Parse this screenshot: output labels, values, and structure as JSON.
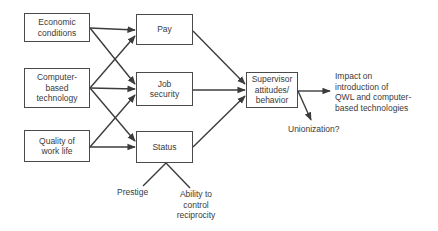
{
  "diagram": {
    "inputs": [
      {
        "id": "economic",
        "lines": [
          "Economic",
          "conditions"
        ]
      },
      {
        "id": "computer",
        "lines": [
          "Computer-",
          "based",
          "technology"
        ]
      },
      {
        "id": "quality",
        "lines": [
          "Quality of",
          "work life"
        ]
      }
    ],
    "mediators": [
      {
        "id": "pay",
        "lines": [
          "Pay"
        ]
      },
      {
        "id": "job_security",
        "lines": [
          "Job",
          "security"
        ]
      },
      {
        "id": "status",
        "lines": [
          "Status"
        ]
      }
    ],
    "central": {
      "id": "supervisor",
      "lines": [
        "Supervisor",
        "attitudes/",
        "behavior"
      ]
    },
    "outcomes": {
      "impact": {
        "lines": [
          "Impact on",
          "introduction of",
          "QWL and computer-",
          "based technologies"
        ]
      },
      "unionization": {
        "text": "Unionization?"
      }
    },
    "status_components": {
      "prestige": {
        "text": "Prestige"
      },
      "ability": {
        "lines": [
          "Ability to",
          "control",
          "reciprocity"
        ]
      }
    },
    "edges": [
      {
        "from": "Economic conditions",
        "to": "Pay",
        "type": "arrow"
      },
      {
        "from": "Economic conditions",
        "to": "Job security",
        "type": "arrow"
      },
      {
        "from": "Computer-based technology",
        "to": "Pay",
        "type": "arrow"
      },
      {
        "from": "Computer-based technology",
        "to": "Job security",
        "type": "arrow"
      },
      {
        "from": "Computer-based technology",
        "to": "Status",
        "type": "arrow"
      },
      {
        "from": "Quality of work life",
        "to": "Job security",
        "type": "arrow"
      },
      {
        "from": "Quality of work life",
        "to": "Status",
        "type": "arrow"
      },
      {
        "from": "Pay",
        "to": "Supervisor attitudes/behavior",
        "type": "arrow"
      },
      {
        "from": "Job security",
        "to": "Supervisor attitudes/behavior",
        "type": "arrow"
      },
      {
        "from": "Status",
        "to": "Supervisor attitudes/behavior",
        "type": "arrow"
      },
      {
        "from": "Supervisor attitudes/behavior",
        "to": "Impact on introduction of QWL and computer-based technologies",
        "type": "arrow"
      },
      {
        "from": "Supervisor attitudes/behavior",
        "to": "Unionization?",
        "type": "arrow"
      },
      {
        "from": "Status",
        "to": "Prestige",
        "type": "line"
      },
      {
        "from": "Status",
        "to": "Ability to control reciprocity",
        "type": "line"
      }
    ],
    "colors": {
      "stroke": "#3c3c3c",
      "text": "#3a3a3a",
      "background": "#ffffff"
    }
  }
}
